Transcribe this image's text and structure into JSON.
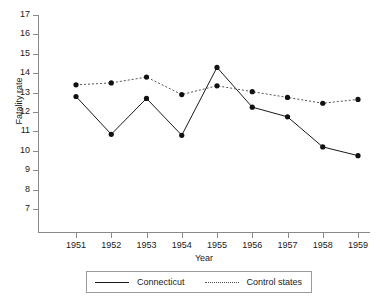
{
  "chart_data": {
    "type": "line",
    "title": "",
    "xlabel": "Year",
    "ylabel": "Fatality rate",
    "categories": [
      "1951",
      "1952",
      "1953",
      "1954",
      "1955",
      "1956",
      "1957",
      "1958",
      "1959"
    ],
    "x": [
      1951,
      1952,
      1953,
      1954,
      1955,
      1956,
      1957,
      1958,
      1959
    ],
    "series": [
      {
        "name": "Connecticut",
        "style": "solid",
        "marker": "filled-circle",
        "color": "#1a1a1a",
        "values": [
          12.8,
          10.85,
          12.7,
          10.8,
          14.3,
          12.25,
          11.75,
          10.2,
          9.75
        ]
      },
      {
        "name": "Control states",
        "style": "dotted",
        "marker": "filled-circle",
        "color": "#555555",
        "values": [
          13.4,
          13.5,
          13.8,
          12.9,
          13.35,
          13.05,
          12.75,
          12.45,
          12.65
        ]
      }
    ],
    "ylim": [
      7,
      17
    ],
    "yticks": [
      7,
      8,
      9,
      10,
      11,
      12,
      13,
      14,
      15,
      16,
      17
    ],
    "ytick_labels": [
      "7",
      "8",
      "9",
      "10",
      "11",
      "12",
      "13",
      "14",
      "15",
      "16",
      "17"
    ],
    "xlim": [
      1950.5,
      1959.5
    ],
    "grid": false,
    "legend_position": "bottom-center",
    "legend_entries": [
      "Connecticut",
      "Control states"
    ]
  },
  "axes": {
    "y_title": "Fatality rate",
    "x_title": "Year"
  },
  "legend": {
    "entry_1": "Connecticut",
    "entry_2": "Control states"
  }
}
